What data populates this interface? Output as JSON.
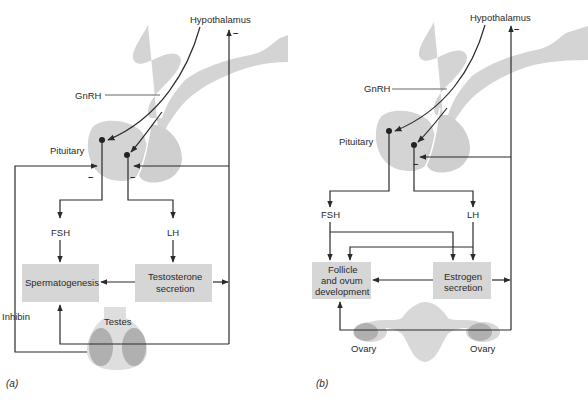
{
  "colors": {
    "anatomy_gray": "#d4d4d4",
    "gonad_dark": "#b0b0b0",
    "box_fill": "#d6d6d6",
    "line": "#2a2a2a",
    "background": "#ffffff"
  },
  "panel_a": {
    "panel_label": "(a)",
    "hypothalamus": "Hypothalamus",
    "gnrh": "GnRH",
    "pituitary": "Pituitary",
    "fsh": "FSH",
    "lh": "LH",
    "box_left": "Spermatogenesis",
    "box_right_line1": "Testosterone",
    "box_right_line2": "secretion",
    "inhibin": "Inhibin",
    "gonad": "Testes",
    "inhibit_sign": "–"
  },
  "panel_b": {
    "panel_label": "(b)",
    "hypothalamus": "Hypothalamus",
    "gnrh": "GnRH",
    "pituitary": "Pituitary",
    "fsh": "FSH",
    "lh": "LH",
    "box_left_line1": "Follicle",
    "box_left_line2": "and ovum",
    "box_left_line3": "development",
    "box_right_line1": "Estrogen",
    "box_right_line2": "secretion",
    "gonad_left": "Ovary",
    "gonad_right": "Ovary",
    "inhibit_sign": "–"
  }
}
